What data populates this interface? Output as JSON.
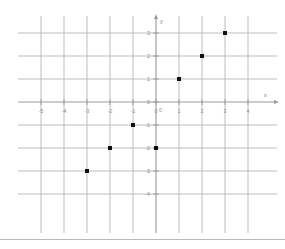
{
  "figure": {
    "kind": "coordinate-grid-scatter",
    "background_color": "#ffffff",
    "grid_line_color": "#b6b6b6",
    "grid_line_color_alt": "#d0d0d0",
    "axis_line_color": "#9a9a9a",
    "point_color": "#111111",
    "tick_label_color": "#8a8a8a",
    "bottom_rule_color": "#b9b9b9"
  },
  "axes": {
    "x_axis_name": "x",
    "y_axis_name": "y",
    "origin_label": "0",
    "x_tick_labels": [
      "-5",
      "-4",
      "-3",
      "-2",
      "-1",
      "0",
      "1",
      "2",
      "3",
      "4"
    ],
    "y_tick_labels": [
      "3",
      "2",
      "1",
      "0",
      "-1",
      "-2",
      "-3",
      "-4"
    ]
  },
  "chart_data": {
    "type": "scatter",
    "title": "",
    "xlabel": "x",
    "ylabel": "y",
    "xlim": [
      -5,
      4
    ],
    "ylim": [
      -4,
      3
    ],
    "xticks": [
      -5,
      -4,
      -3,
      -2,
      -1,
      0,
      1,
      2,
      3,
      4
    ],
    "yticks": [
      -4,
      -3,
      -2,
      -1,
      0,
      1,
      2,
      3
    ],
    "grid": true,
    "legend": null,
    "series": [
      {
        "name": "plotted points",
        "marker": "square",
        "color": "#111111",
        "points": [
          {
            "x": -3,
            "y": -3
          },
          {
            "x": -2,
            "y": -2
          },
          {
            "x": -1,
            "y": -1
          },
          {
            "x": 0,
            "y": -2
          },
          {
            "x": 1,
            "y": 1
          },
          {
            "x": 2,
            "y": 2
          },
          {
            "x": 3,
            "y": 3
          }
        ]
      }
    ]
  }
}
